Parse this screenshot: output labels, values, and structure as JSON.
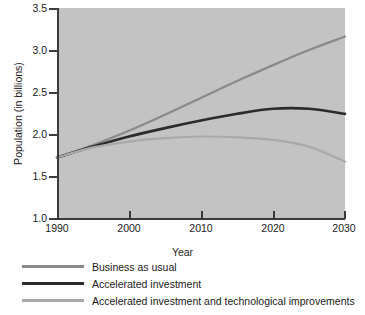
{
  "chart_data": {
    "type": "line",
    "title": "",
    "xlabel": "Year",
    "ylabel": "Population (in billions)",
    "xlim": [
      1990,
      2030
    ],
    "ylim": [
      1.0,
      3.5
    ],
    "xticks": [
      "1990",
      "2000",
      "2010",
      "2020",
      "2030"
    ],
    "yticks": [
      "1.0",
      "1.5",
      "2.0",
      "2.5",
      "3.0",
      "3.5"
    ],
    "grid": false,
    "legend_position": "below-axes-left",
    "plot_background": "#c3c3c3",
    "x": [
      1990,
      1995,
      2000,
      2005,
      2010,
      2015,
      2020,
      2025,
      2030
    ],
    "series": [
      {
        "name": "Business as usual",
        "color": "#8a8a8a",
        "values": [
          1.72,
          1.87,
          2.04,
          2.23,
          2.43,
          2.63,
          2.82,
          3.0,
          3.16
        ]
      },
      {
        "name": "Accelerated investment",
        "color": "#2b2b2b",
        "values": [
          1.72,
          1.85,
          1.97,
          2.07,
          2.16,
          2.24,
          2.3,
          2.3,
          2.24
        ]
      },
      {
        "name": "Accelerated investment and technological improvements",
        "color": "#a9a9a9",
        "values": [
          1.72,
          1.84,
          1.91,
          1.95,
          1.97,
          1.96,
          1.93,
          1.85,
          1.67
        ]
      }
    ]
  },
  "axes": {
    "ylabel": "Population (in billions)",
    "xlabel": "Year",
    "ytick_labels": [
      "3.5",
      "3.0",
      "2.5",
      "2.0",
      "1.5",
      "1.0"
    ],
    "xtick_labels": [
      "1990",
      "2000",
      "2010",
      "2020",
      "2030"
    ]
  },
  "legend": {
    "items": [
      {
        "label": "Business as usual",
        "color": "#8a8a8a"
      },
      {
        "label": "Accelerated investment",
        "color": "#2b2b2b"
      },
      {
        "label": "Accelerated investment and technological improvements",
        "color": "#a9a9a9"
      }
    ]
  }
}
